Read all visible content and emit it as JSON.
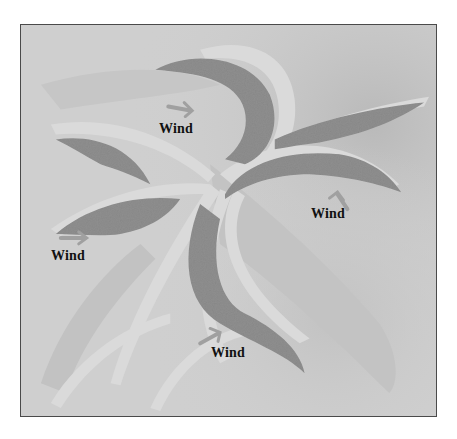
{
  "figure": {
    "type": "sketch-diagram",
    "colors": {
      "page_background": "#ffffff",
      "frame_border": "#4a4a4a",
      "sand_background": "#cfcfcf",
      "sand_shadow": "#bdbdbd",
      "crest_highlight": "#dadada",
      "slip_face": "#8f8f8f",
      "arrow": "#a0a0a0",
      "label_text": "#111111"
    }
  },
  "labels": [
    {
      "id": "wind-top",
      "text": "Wind",
      "arrow_direction": "right"
    },
    {
      "id": "wind-right",
      "text": "Wind",
      "arrow_direction": "up-left"
    },
    {
      "id": "wind-left",
      "text": "Wind",
      "arrow_direction": "right"
    },
    {
      "id": "wind-bottom",
      "text": "Wind",
      "arrow_direction": "right"
    }
  ]
}
